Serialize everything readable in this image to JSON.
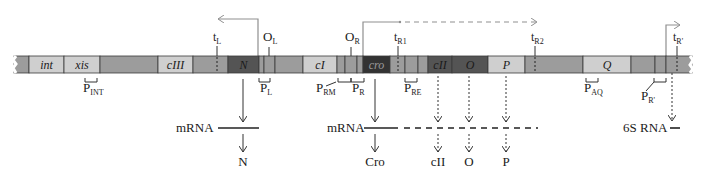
{
  "colors": {
    "light": "#cfcfcf",
    "medium": "#9c9c9c",
    "dark": "#545454",
    "darker": "#333333",
    "outline": "#3a3a3a",
    "arrow": "#8f8f8f",
    "text": "#1a1a1a"
  },
  "bar": {
    "y": 56,
    "height": 17,
    "x_start": 14,
    "x_end": 692
  },
  "segments": [
    {
      "x0": 14,
      "x1": 29,
      "shade": "medium",
      "label": ""
    },
    {
      "x0": 29,
      "x1": 64,
      "shade": "light",
      "label": "int"
    },
    {
      "x0": 64,
      "x1": 100,
      "shade": "light",
      "label": "xis"
    },
    {
      "x0": 100,
      "x1": 158,
      "shade": "medium",
      "label": ""
    },
    {
      "x0": 158,
      "x1": 193,
      "shade": "light",
      "label": "cIII"
    },
    {
      "x0": 193,
      "x1": 228,
      "shade": "medium",
      "label": ""
    },
    {
      "x0": 228,
      "x1": 259,
      "shade": "dark",
      "label": "N"
    },
    {
      "x0": 259,
      "x1": 264,
      "shade": "medium",
      "label": ""
    },
    {
      "x0": 264,
      "x1": 275,
      "shade": "medium",
      "label": ""
    },
    {
      "x0": 275,
      "x1": 303,
      "shade": "medium",
      "label": ""
    },
    {
      "x0": 303,
      "x1": 337,
      "shade": "light",
      "label": "cI"
    },
    {
      "x0": 337,
      "x1": 345,
      "shade": "medium",
      "label": ""
    },
    {
      "x0": 345,
      "x1": 357,
      "shade": "medium",
      "label": ""
    },
    {
      "x0": 357,
      "x1": 363,
      "shade": "medium",
      "label": ""
    },
    {
      "x0": 363,
      "x1": 390,
      "shade": "darker",
      "label": "cro"
    },
    {
      "x0": 390,
      "x1": 405,
      "shade": "medium",
      "label": ""
    },
    {
      "x0": 405,
      "x1": 418,
      "shade": "medium",
      "label": ""
    },
    {
      "x0": 418,
      "x1": 428,
      "shade": "medium",
      "label": ""
    },
    {
      "x0": 428,
      "x1": 452,
      "shade": "dark",
      "label": "cII"
    },
    {
      "x0": 452,
      "x1": 488,
      "shade": "dark",
      "label": "O"
    },
    {
      "x0": 488,
      "x1": 525,
      "shade": "light",
      "label": "P"
    },
    {
      "x0": 525,
      "x1": 583,
      "shade": "medium",
      "label": ""
    },
    {
      "x0": 583,
      "x1": 631,
      "shade": "light",
      "label": "Q"
    },
    {
      "x0": 631,
      "x1": 655,
      "shade": "medium",
      "label": ""
    },
    {
      "x0": 655,
      "x1": 666,
      "shade": "medium",
      "label": ""
    },
    {
      "x0": 666,
      "x1": 692,
      "shade": "medium",
      "label": ""
    }
  ],
  "terminators": [
    {
      "name": "tL",
      "main": "t",
      "sub": "L",
      "x": 217,
      "label_y": 41
    },
    {
      "name": "tR1",
      "main": "t",
      "sub": "R1",
      "x": 398,
      "label_y": 41
    },
    {
      "name": "tR2",
      "main": "t",
      "sub": "R2",
      "x": 535,
      "label_y": 41
    },
    {
      "name": "tR'",
      "main": "t",
      "sub": "R'",
      "x": 677,
      "label_y": 41
    }
  ],
  "operators": [
    {
      "name": "OL",
      "main": "O",
      "sub": "L",
      "x": 269,
      "label_y": 41
    },
    {
      "name": "OR",
      "main": "O",
      "sub": "R",
      "x": 351,
      "label_y": 41
    }
  ],
  "promoters": [
    {
      "name": "PINT",
      "main": "P",
      "sub": "INT",
      "bx0": 85,
      "bx1": 97,
      "label_x": 83,
      "label_y": 92,
      "leader": null
    },
    {
      "name": "PL",
      "main": "P",
      "sub": "L",
      "bx0": 259,
      "bx1": 270,
      "label_x": 260,
      "label_y": 92,
      "leader": null
    },
    {
      "name": "PRM",
      "main": "P",
      "sub": "RM",
      "bx0": 338,
      "bx1": 351,
      "label_x": 316,
      "label_y": 92,
      "leader": [
        336,
        82,
        326,
        86
      ]
    },
    {
      "name": "PR",
      "main": "P",
      "sub": "R",
      "bx0": 351,
      "bx1": 364,
      "label_x": 352,
      "label_y": 92,
      "leader": null
    },
    {
      "name": "PRE",
      "main": "P",
      "sub": "RE",
      "bx0": 405,
      "bx1": 417,
      "label_x": 404,
      "label_y": 92,
      "leader": null
    },
    {
      "name": "PAQ",
      "main": "P",
      "sub": "AQ",
      "bx0": 586,
      "bx1": 598,
      "label_x": 584,
      "label_y": 92,
      "leader": null
    },
    {
      "name": "PR'",
      "main": "P",
      "sub": "R'",
      "bx0": 654,
      "bx1": 666,
      "label_x": 641,
      "label_y": 100,
      "leader": [
        654,
        82,
        646,
        91
      ]
    }
  ],
  "transcripts": [
    {
      "name": "leftward",
      "from_x": 258,
      "from_y": 56,
      "top_y": 19,
      "to_x": 218,
      "dir": "left",
      "dashed_from": null
    },
    {
      "name": "rightward",
      "from_x": 363,
      "from_y": 56,
      "top_y": 22,
      "to_x": 537,
      "dir": "right",
      "dashed_from": 400
    },
    {
      "name": "rightward-late",
      "from_x": 666,
      "from_y": 56,
      "top_y": 25,
      "to_x": 680,
      "dir": "right",
      "dashed_from": null
    }
  ],
  "mrna": [
    {
      "label": "mRNA",
      "label_x": 176,
      "y": 128,
      "solid": [
        218,
        259
      ],
      "dashed": null
    },
    {
      "label": "mRNA",
      "label_x": 327,
      "y": 128,
      "solid": [
        364,
        398
      ],
      "dashed": [
        404,
        538
      ]
    },
    {
      "label": "6S RNA",
      "label_x": 623,
      "y": 128,
      "solid": [
        670,
        680
      ],
      "dashed": null
    }
  ],
  "products": [
    {
      "label": "N",
      "x": 243,
      "solid": true,
      "y_label": 166
    },
    {
      "label": "Cro",
      "x": 375,
      "solid": true,
      "y_label": 166
    },
    {
      "label": "cII",
      "x": 438,
      "solid": false,
      "y_label": 166
    },
    {
      "label": "O",
      "x": 469,
      "solid": false,
      "y_label": 166
    },
    {
      "label": "P",
      "x": 506,
      "solid": false,
      "y_label": 166
    }
  ],
  "sixS": {
    "x": 672,
    "y_top": 73,
    "y_bot": 121
  }
}
